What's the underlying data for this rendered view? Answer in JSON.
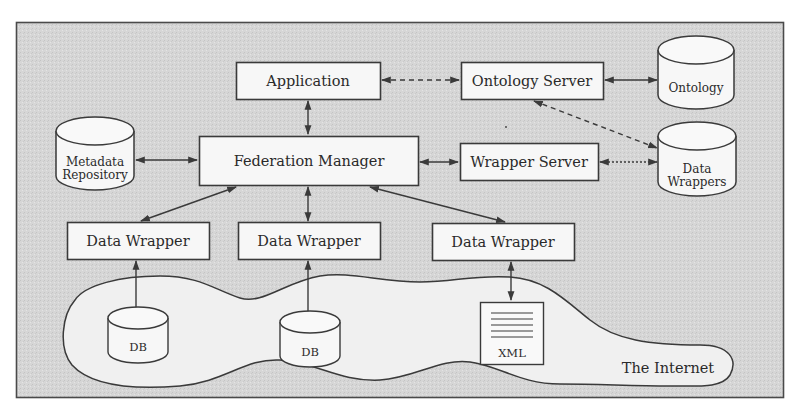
{
  "colors": {
    "page_background": "#ffffff",
    "frame_fill": "#d9d9d9",
    "frame_stroke": "#4a4a4a",
    "node_fill": "#f7f7f7",
    "node_stroke": "#3a3a3a",
    "cloud_fill": "#eeeeee",
    "text": "#2a2a2a"
  },
  "nodes": {
    "application": {
      "label": "Application"
    },
    "ontology_server": {
      "label": "Ontology Server"
    },
    "ontology_db": {
      "label": "Ontology"
    },
    "metadata_repository": {
      "label_line1": "Metadata",
      "label_line2": "Repository"
    },
    "federation_manager": {
      "label": "Federation Manager"
    },
    "wrapper_server": {
      "label": "Wrapper Server"
    },
    "data_wrappers_db": {
      "label_line1": "Data",
      "label_line2": "Wrappers"
    },
    "data_wrapper_1": {
      "label": "Data Wrapper"
    },
    "data_wrapper_2": {
      "label": "Data Wrapper"
    },
    "data_wrapper_3": {
      "label": "Data Wrapper"
    },
    "db_1": {
      "label": "DB"
    },
    "db_2": {
      "label": "DB"
    },
    "xml_doc": {
      "label": "XML"
    },
    "internet": {
      "label": "The Internet"
    }
  },
  "edges": [
    {
      "from": "application",
      "to": "ontology_server",
      "style": "dashed",
      "direction": "both"
    },
    {
      "from": "ontology_server",
      "to": "ontology_db",
      "style": "solid",
      "direction": "both"
    },
    {
      "from": "application",
      "to": "federation_manager",
      "style": "solid",
      "direction": "both"
    },
    {
      "from": "metadata_repository",
      "to": "federation_manager",
      "style": "solid",
      "direction": "both"
    },
    {
      "from": "federation_manager",
      "to": "wrapper_server",
      "style": "solid",
      "direction": "both"
    },
    {
      "from": "wrapper_server",
      "to": "data_wrappers_db",
      "style": "dotted",
      "direction": "both"
    },
    {
      "from": "ontology_server",
      "to": "data_wrappers_db",
      "style": "dashed",
      "direction": "both"
    },
    {
      "from": "federation_manager",
      "to": "data_wrapper_1",
      "style": "solid",
      "direction": "both"
    },
    {
      "from": "federation_manager",
      "to": "data_wrapper_2",
      "style": "solid",
      "direction": "both"
    },
    {
      "from": "federation_manager",
      "to": "data_wrapper_3",
      "style": "solid",
      "direction": "both"
    },
    {
      "from": "data_wrapper_1",
      "to": "db_1",
      "style": "solid",
      "direction": "both"
    },
    {
      "from": "data_wrapper_2",
      "to": "db_2",
      "style": "solid",
      "direction": "both"
    },
    {
      "from": "data_wrapper_3",
      "to": "xml_doc",
      "style": "solid",
      "direction": "both"
    }
  ]
}
